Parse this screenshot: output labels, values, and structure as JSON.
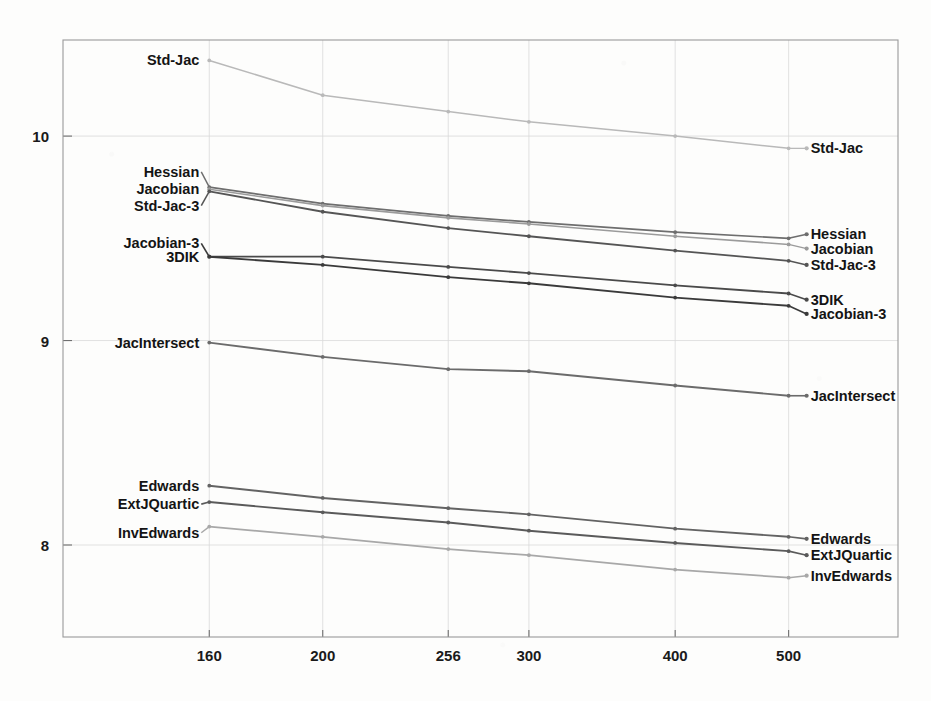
{
  "chart_data": {
    "type": "line",
    "title": "",
    "subtitle": "",
    "xlabel": "",
    "ylabel": "",
    "xscale": "log",
    "x": [
      160,
      200,
      256,
      300,
      400,
      500
    ],
    "xtick_labels": [
      "160",
      "200",
      "256",
      "300",
      "400",
      "500"
    ],
    "ytick_labels": [
      "10",
      "9",
      "8"
    ],
    "yticks": [
      10,
      9,
      8
    ],
    "ylim": [
      7.55,
      10.47
    ],
    "xlim": [
      120,
      620
    ],
    "grid": true,
    "legend": "inline-endpoint-labels",
    "series": [
      {
        "name": "Std-Jac",
        "color": "#b9b9b9",
        "width": 1.5,
        "label_left": "Std-Jac",
        "label_right": "Std-Jac",
        "values": [
          10.37,
          10.2,
          10.12,
          10.07,
          10.0,
          9.94
        ]
      },
      {
        "name": "Hessian",
        "color": "#6e6e6e",
        "width": 1.7,
        "label_left": "Hessian",
        "label_right": "Hessian",
        "values": [
          9.75,
          9.67,
          9.61,
          9.58,
          9.53,
          9.5
        ]
      },
      {
        "name": "Jacobian",
        "color": "#9b9b9b",
        "width": 1.6,
        "label_left": "Jacobian",
        "label_right": "Jacobian",
        "values": [
          9.74,
          9.66,
          9.6,
          9.57,
          9.51,
          9.47
        ]
      },
      {
        "name": "Std-Jac-3",
        "color": "#555555",
        "width": 1.8,
        "label_left": "Std-Jac-3",
        "label_right": "Std-Jac-3",
        "values": [
          9.73,
          9.63,
          9.55,
          9.51,
          9.44,
          9.39
        ]
      },
      {
        "name": "3DIK",
        "color": "#4a4a4a",
        "width": 1.8,
        "label_left": "3DIK",
        "label_right": "3DIK",
        "values": [
          9.41,
          9.41,
          9.36,
          9.33,
          9.27,
          9.23
        ]
      },
      {
        "name": "Jacobian-3",
        "color": "#3a3a3a",
        "width": 1.9,
        "label_left": "Jacobian-3",
        "label_right": "Jacobian-3",
        "values": [
          9.41,
          9.37,
          9.31,
          9.28,
          9.21,
          9.17
        ]
      },
      {
        "name": "JacIntersect",
        "color": "#6b6b6b",
        "width": 1.9,
        "label_left": "JacIntersect",
        "label_right": "JacIntersect",
        "values": [
          8.99,
          8.92,
          8.86,
          8.85,
          8.78,
          8.73
        ]
      },
      {
        "name": "Edwards",
        "color": "#636363",
        "width": 1.9,
        "label_left": "Edwards",
        "label_right": "Edwards",
        "values": [
          8.29,
          8.23,
          8.18,
          8.15,
          8.08,
          8.04
        ]
      },
      {
        "name": "ExtJQuartic",
        "color": "#5a5a5a",
        "width": 1.9,
        "label_left": "ExtJQuartic",
        "label_right": "ExtJQuartic",
        "values": [
          8.21,
          8.16,
          8.11,
          8.07,
          8.01,
          7.97
        ]
      },
      {
        "name": "InvEdwards",
        "color": "#a8a8a8",
        "width": 1.7,
        "label_left": "InvEdwards",
        "label_right": "InvEdwards",
        "values": [
          8.09,
          8.04,
          7.98,
          7.95,
          7.88,
          7.84
        ]
      }
    ],
    "left_label_anchors": {
      "Std-Jac": 10.37,
      "Hessian": 9.825,
      "Jacobian": 9.74,
      "Std-Jac-3": 9.66,
      "Jacobian-3": 9.475,
      "3DIK": 9.41,
      "JacIntersect": 8.99,
      "Edwards": 8.29,
      "ExtJQuartic": 8.2,
      "InvEdwards": 8.06
    },
    "right_label_anchors": {
      "Std-Jac": 9.94,
      "Hessian": 9.52,
      "Jacobian": 9.45,
      "Std-Jac-3": 9.37,
      "3DIK": 9.2,
      "Jacobian-3": 9.13,
      "JacIntersect": 8.73,
      "Edwards": 8.03,
      "ExtJQuartic": 7.95,
      "InvEdwards": 7.85
    }
  }
}
